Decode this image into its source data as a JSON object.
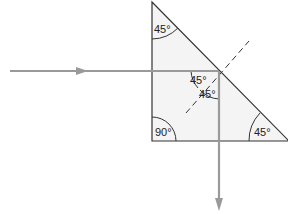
{
  "diagram": {
    "angles": {
      "top": "45°",
      "incidence": "45°",
      "reflection": "45°",
      "bottom_left": "90°",
      "bottom_right": "45°"
    },
    "colors": {
      "prism_fill": "#f4f4f4",
      "prism_stroke": "#333333",
      "ray": "#9a9a9a",
      "normal": "#333333"
    }
  }
}
